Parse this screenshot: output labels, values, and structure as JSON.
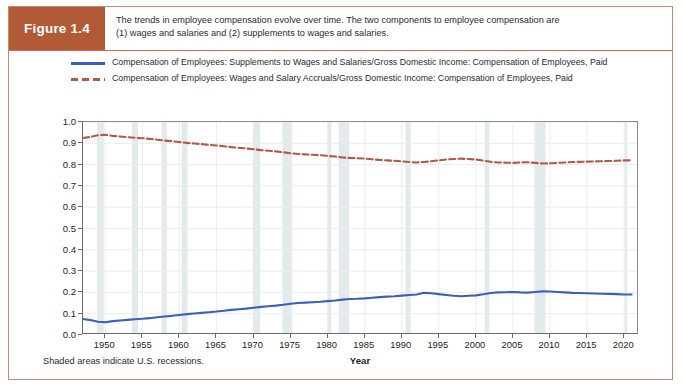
{
  "figure": {
    "badge_label": "Figure 1.4",
    "caption_line1": "The trends in employee compensation evolve over time. The two components to employee compensation are",
    "caption_line2": "(1) wages and salaries and (2) supplements to wages and salaries.",
    "footnote": "Shaded areas indicate U.S. recessions.",
    "badge_color": "#b15a35",
    "border_color": "#c78a6e"
  },
  "legend": {
    "position": "above-plot",
    "entries": [
      {
        "name": "supplements-series",
        "style": "solid",
        "color": "#3a5fc0",
        "line1": "Compensation of Employees: Supplements to Wages and Salaries/Gross Domestic Income: Compensation",
        "line2": "of Employees, Paid"
      },
      {
        "name": "wages-series",
        "style": "dashed",
        "color": "#b5574a",
        "line1": "Compensation of Employees: Wages and Salary Accruals/Gross Domestic Income: Compensation of",
        "line2": "Employees, Paid"
      }
    ]
  },
  "chart_data": {
    "type": "line",
    "title": "",
    "xlabel": "Year",
    "ylabel": "Bil. of $/Bil. of $",
    "xlim": [
      1947,
      2022
    ],
    "ylim": [
      0.0,
      1.0
    ],
    "grid": true,
    "xticks": [
      1950,
      1955,
      1960,
      1965,
      1970,
      1975,
      1980,
      1985,
      1990,
      1995,
      2000,
      2005,
      2010,
      2015,
      2020
    ],
    "yticks": [
      "0.0",
      "0.1",
      "0.2",
      "0.3",
      "0.4",
      "0.5",
      "0.6",
      "0.7",
      "0.8",
      "0.9",
      "1.0"
    ],
    "x": [
      1947,
      1948,
      1949,
      1950,
      1951,
      1952,
      1953,
      1954,
      1955,
      1956,
      1957,
      1958,
      1959,
      1960,
      1961,
      1962,
      1963,
      1964,
      1965,
      1966,
      1967,
      1968,
      1969,
      1970,
      1971,
      1972,
      1973,
      1974,
      1975,
      1976,
      1977,
      1978,
      1979,
      1980,
      1981,
      1982,
      1983,
      1984,
      1985,
      1986,
      1987,
      1988,
      1989,
      1990,
      1991,
      1992,
      1993,
      1994,
      1995,
      1996,
      1997,
      1998,
      1999,
      2000,
      2001,
      2002,
      2003,
      2004,
      2005,
      2006,
      2007,
      2008,
      2009,
      2010,
      2011,
      2012,
      2013,
      2014,
      2015,
      2016,
      2017,
      2018,
      2019,
      2020,
      2021
    ],
    "series": [
      {
        "name": "Compensation of Employees: Wages and Salary Accruals/Gross Domestic Income: Compensation of Employees, Paid",
        "short_name": "wages-and-salary-accruals",
        "color": "#b5574a",
        "style": "dashed",
        "values": [
          0.925,
          0.93,
          0.938,
          0.94,
          0.935,
          0.932,
          0.929,
          0.926,
          0.924,
          0.921,
          0.917,
          0.913,
          0.91,
          0.906,
          0.902,
          0.899,
          0.896,
          0.893,
          0.89,
          0.886,
          0.882,
          0.879,
          0.876,
          0.872,
          0.868,
          0.865,
          0.862,
          0.858,
          0.853,
          0.85,
          0.848,
          0.846,
          0.844,
          0.841,
          0.838,
          0.834,
          0.831,
          0.83,
          0.828,
          0.825,
          0.822,
          0.82,
          0.818,
          0.815,
          0.812,
          0.81,
          0.812,
          0.816,
          0.82,
          0.824,
          0.826,
          0.828,
          0.826,
          0.824,
          0.819,
          0.813,
          0.81,
          0.809,
          0.808,
          0.81,
          0.811,
          0.808,
          0.805,
          0.806,
          0.808,
          0.81,
          0.812,
          0.813,
          0.814,
          0.815,
          0.816,
          0.817,
          0.818,
          0.82,
          0.82
        ]
      },
      {
        "name": "Compensation of Employees: Supplements to Wages and Salaries/Gross Domestic Income: Compensation of Employees, Paid",
        "short_name": "supplements-to-wages-and-salaries",
        "color": "#3a5fc0",
        "style": "solid",
        "values": [
          0.075,
          0.07,
          0.062,
          0.06,
          0.065,
          0.068,
          0.071,
          0.074,
          0.076,
          0.079,
          0.083,
          0.087,
          0.09,
          0.094,
          0.098,
          0.101,
          0.104,
          0.107,
          0.11,
          0.114,
          0.118,
          0.121,
          0.124,
          0.128,
          0.132,
          0.135,
          0.138,
          0.142,
          0.147,
          0.15,
          0.152,
          0.154,
          0.156,
          0.159,
          0.162,
          0.166,
          0.169,
          0.17,
          0.172,
          0.175,
          0.178,
          0.18,
          0.182,
          0.185,
          0.188,
          0.19,
          0.198,
          0.196,
          0.192,
          0.188,
          0.184,
          0.182,
          0.184,
          0.186,
          0.191,
          0.197,
          0.2,
          0.201,
          0.202,
          0.2,
          0.199,
          0.202,
          0.205,
          0.204,
          0.202,
          0.2,
          0.198,
          0.197,
          0.196,
          0.195,
          0.194,
          0.193,
          0.192,
          0.19,
          0.19
        ]
      }
    ],
    "recessions": [
      [
        1948.9,
        1949.8
      ],
      [
        1953.6,
        1954.4
      ],
      [
        1957.6,
        1958.3
      ],
      [
        1960.3,
        1961.1
      ],
      [
        1969.9,
        1970.9
      ],
      [
        1973.9,
        1975.2
      ],
      [
        1980.0,
        1980.5
      ],
      [
        1981.5,
        1982.9
      ],
      [
        1990.5,
        1991.2
      ],
      [
        2001.2,
        2001.8
      ],
      [
        2007.9,
        2009.4
      ],
      [
        2020.1,
        2020.4
      ]
    ],
    "recession_color": "#dde6e9"
  }
}
